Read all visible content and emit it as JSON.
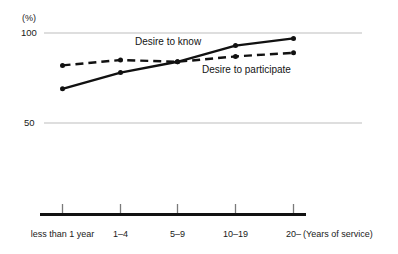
{
  "chart_data": {
    "type": "line",
    "title": "",
    "subtitle": "",
    "unit_label": "(%)",
    "xlabel": "(Years of service)",
    "ylabel": "",
    "categories": [
      "less than 1 year",
      "1–4",
      "5–9",
      "10–19",
      "20–"
    ],
    "ylim": [
      0,
      100
    ],
    "yticks": [
      50,
      100
    ],
    "ytick_labels": [
      "50",
      "100"
    ],
    "grid": true,
    "grid_axis": "y",
    "legend": "inline-annotations",
    "series": [
      {
        "name": "Desire to know",
        "style": "solid",
        "color": "#111111",
        "marker": "dot",
        "values": [
          69,
          78,
          84,
          93,
          97
        ]
      },
      {
        "name": "Desire to participate",
        "style": "dashed",
        "color": "#111111",
        "marker": "dot",
        "values": [
          82,
          85,
          84,
          87,
          89
        ]
      }
    ],
    "annotations": [
      {
        "text": "Desire to know",
        "near_series": "Desire to know"
      },
      {
        "text": "Desire to participate",
        "near_series": "Desire to participate"
      }
    ]
  },
  "axes": {
    "unit": "(%)",
    "y_labels": {
      "top": "100",
      "mid": "50"
    },
    "x_caption": "(Years of service)",
    "x_labels": [
      "less than 1 year",
      "1–4",
      "5–9",
      "10–19",
      "20–"
    ]
  },
  "colors": {
    "ink": "#111111",
    "grid": "#bdbdbd",
    "axis": "#111111",
    "background": "#ffffff"
  }
}
